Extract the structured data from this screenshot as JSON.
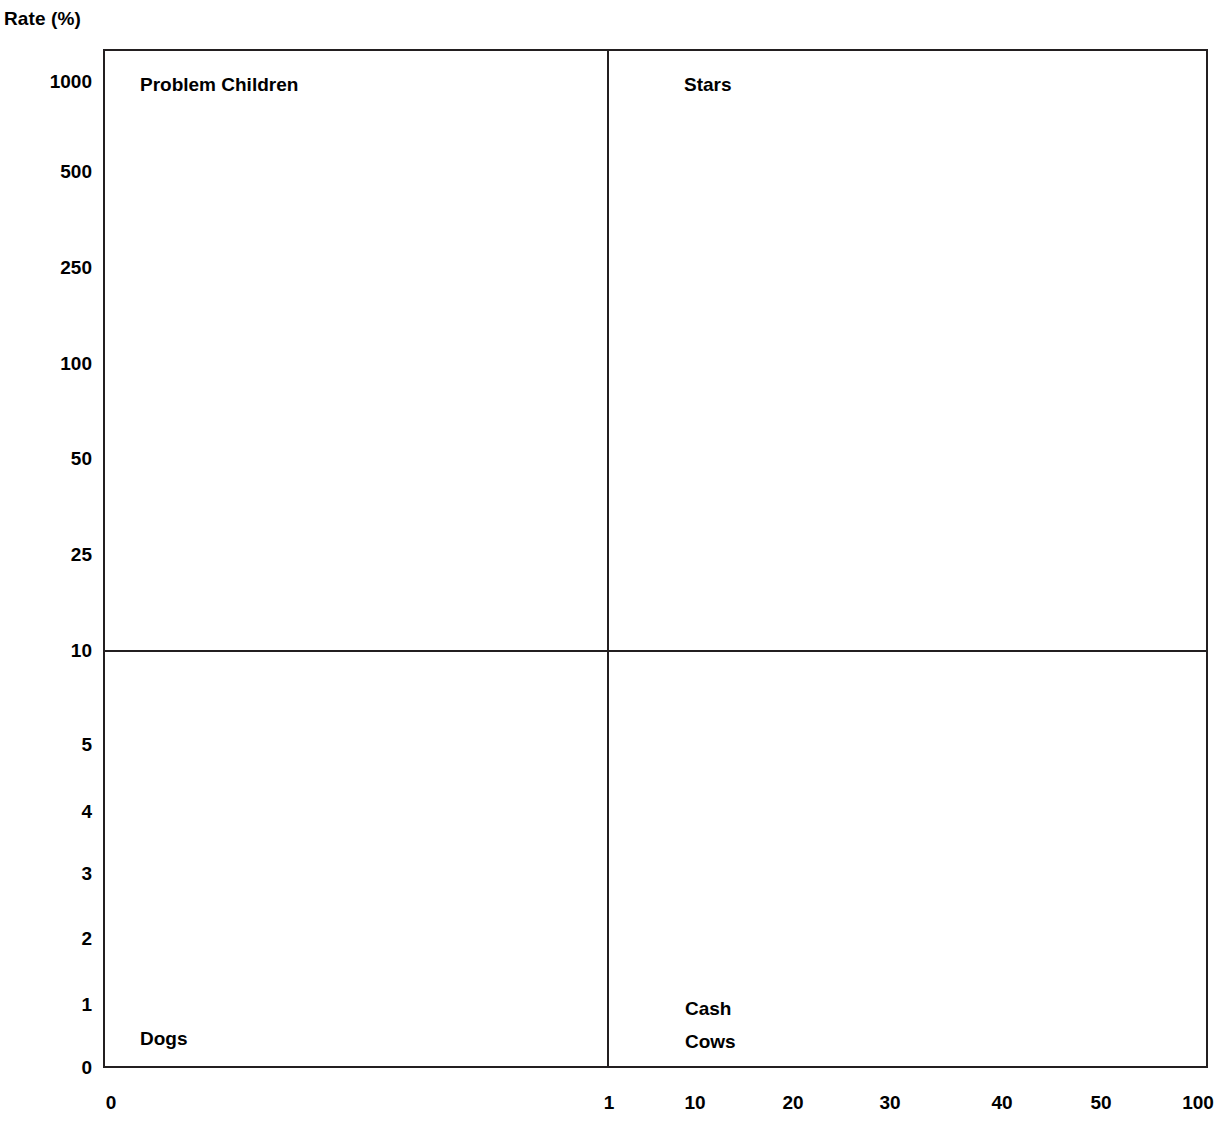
{
  "chart_data": {
    "type": "scatter",
    "title": "",
    "ylabel": "Rate (%)",
    "xlabel": "",
    "grid": false,
    "legend": "none",
    "axis_title": "Rate (%)",
    "y_ticks": [
      {
        "label": "1000",
        "y": 82
      },
      {
        "label": "500",
        "y": 172
      },
      {
        "label": "250",
        "y": 268
      },
      {
        "label": "100",
        "y": 364
      },
      {
        "label": "50",
        "y": 459
      },
      {
        "label": "25",
        "y": 555
      },
      {
        "label": "10",
        "y": 651
      },
      {
        "label": "5",
        "y": 745
      },
      {
        "label": "4",
        "y": 812
      },
      {
        "label": "3",
        "y": 874
      },
      {
        "label": "2",
        "y": 939
      },
      {
        "label": "1",
        "y": 1005
      },
      {
        "label": "0",
        "y": 1068
      }
    ],
    "x_ticks": [
      {
        "label": "0",
        "x": 111
      },
      {
        "label": "1",
        "x": 609
      },
      {
        "label": "10",
        "x": 695
      },
      {
        "label": "20",
        "x": 793
      },
      {
        "label": "30",
        "x": 890
      },
      {
        "label": "40",
        "x": 1002
      },
      {
        "label": "50",
        "x": 1101
      },
      {
        "label": "100",
        "x": 1198
      }
    ],
    "quadrants": [
      {
        "name": "problem-children",
        "label": "Problem Children",
        "x": 140,
        "y": 68,
        "position": "top-left"
      },
      {
        "name": "stars",
        "label": "Stars",
        "x": 684,
        "y": 68,
        "position": "top-right"
      },
      {
        "name": "dogs",
        "label": "Dogs",
        "x": 140,
        "y": 1022,
        "position": "bottom-left"
      },
      {
        "name": "cash-cows",
        "label": "Cash\nCows",
        "x": 685,
        "y": 992,
        "position": "bottom-right"
      }
    ],
    "dividers": {
      "vertical_x_value": "1",
      "horizontal_y_value": "10"
    },
    "values": [],
    "series": [],
    "colors": {
      "line": "#231f20",
      "background": "#ffffff",
      "text": "#000000"
    }
  }
}
